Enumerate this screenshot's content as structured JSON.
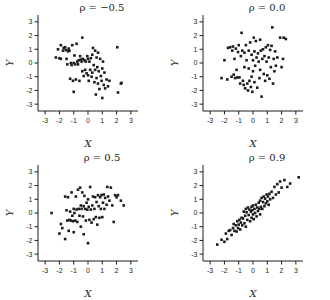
{
  "figure": {
    "background": "#ffffff",
    "ink_color": "#1c1c1c",
    "layout": "2x2-scatter-grid"
  },
  "chart_data": [
    {
      "type": "scatter",
      "title": "ρ = −0.5",
      "rho": -0.5,
      "xlabel": "X",
      "ylabel": "Y",
      "xlim": [
        -3.5,
        3.5
      ],
      "ylim": [
        -3.5,
        3.5
      ],
      "xticks": [
        -3,
        -2,
        -1,
        0,
        1,
        2,
        3
      ],
      "yticks": [
        3,
        2,
        1,
        0,
        -1,
        -2,
        -3
      ],
      "grid": false,
      "marker": "square",
      "points": [
        [
          -2.25,
          0.4
        ],
        [
          -2.1,
          1.0
        ],
        [
          -2.0,
          0.35
        ],
        [
          -1.9,
          0.3
        ],
        [
          -1.9,
          1.3
        ],
        [
          -1.75,
          0.9
        ],
        [
          -1.7,
          1.1
        ],
        [
          -1.6,
          1.15
        ],
        [
          -1.55,
          0.95
        ],
        [
          -1.5,
          0.3
        ],
        [
          -1.45,
          -0.1
        ],
        [
          -1.4,
          0.85
        ],
        [
          -1.35,
          1.05
        ],
        [
          -1.3,
          0.9
        ],
        [
          -1.25,
          -1.15
        ],
        [
          -1.2,
          0.0
        ],
        [
          -1.15,
          -0.15
        ],
        [
          -1.1,
          1.3
        ],
        [
          -1.05,
          -1.3
        ],
        [
          -1.0,
          0.0
        ],
        [
          -1.0,
          -2.1
        ],
        [
          -0.95,
          0.55
        ],
        [
          -0.9,
          -0.1
        ],
        [
          -0.85,
          -1.2
        ],
        [
          -0.8,
          1.4
        ],
        [
          -0.75,
          0.1
        ],
        [
          -0.7,
          -0.1
        ],
        [
          -0.65,
          0.2
        ],
        [
          -0.6,
          -1.3
        ],
        [
          -0.55,
          0.5
        ],
        [
          -0.5,
          0.25
        ],
        [
          -0.45,
          0.1
        ],
        [
          -0.4,
          1.85
        ],
        [
          -0.4,
          -0.6
        ],
        [
          -0.35,
          0.3
        ],
        [
          -0.3,
          -0.95
        ],
        [
          -0.25,
          0.2
        ],
        [
          -0.2,
          -0.5
        ],
        [
          -0.15,
          0.1
        ],
        [
          -0.1,
          -0.75
        ],
        [
          -0.05,
          0.5
        ],
        [
          0.0,
          0.3
        ],
        [
          0.0,
          -0.9
        ],
        [
          0.05,
          -1.3
        ],
        [
          0.1,
          0.1
        ],
        [
          0.15,
          -0.5
        ],
        [
          0.2,
          0.35
        ],
        [
          0.25,
          -1.0
        ],
        [
          0.3,
          0.6
        ],
        [
          0.3,
          -0.7
        ],
        [
          0.35,
          1.1
        ],
        [
          0.4,
          -0.15
        ],
        [
          0.45,
          -1.4
        ],
        [
          0.5,
          0.9
        ],
        [
          0.5,
          -0.5
        ],
        [
          0.55,
          -2.3
        ],
        [
          0.6,
          0.4
        ],
        [
          0.6,
          -1.1
        ],
        [
          0.65,
          -0.3
        ],
        [
          0.7,
          0.75
        ],
        [
          0.7,
          -1.5
        ],
        [
          0.75,
          -0.6
        ],
        [
          0.8,
          -1.9
        ],
        [
          0.85,
          0.3
        ],
        [
          0.9,
          -0.95
        ],
        [
          0.95,
          -1.3
        ],
        [
          1.0,
          -0.4
        ],
        [
          1.0,
          -2.55
        ],
        [
          1.05,
          0.1
        ],
        [
          1.1,
          -1.6
        ],
        [
          1.15,
          -0.7
        ],
        [
          1.2,
          -1.85
        ],
        [
          1.3,
          -1.2
        ],
        [
          1.4,
          -1.7
        ],
        [
          1.5,
          -1.3
        ],
        [
          2.05,
          1.15
        ],
        [
          2.1,
          -2.15
        ],
        [
          2.3,
          -1.5
        ],
        [
          2.35,
          -1.45
        ]
      ]
    },
    {
      "type": "scatter",
      "title": "ρ = 0.0",
      "rho": 0.0,
      "xlabel": "X",
      "ylabel": "Y",
      "xlim": [
        -3.5,
        3.5
      ],
      "ylim": [
        -3.5,
        3.5
      ],
      "xticks": [
        -3,
        -2,
        -1,
        0,
        1,
        2,
        3
      ],
      "yticks": [
        3,
        2,
        1,
        0,
        -1,
        -2,
        -3
      ],
      "grid": false,
      "marker": "square",
      "points": [
        [
          -2.2,
          -1.1
        ],
        [
          -2.0,
          0.2
        ],
        [
          -1.8,
          -1.2
        ],
        [
          -1.75,
          1.1
        ],
        [
          -1.6,
          1.15
        ],
        [
          -1.5,
          -1.0
        ],
        [
          -1.45,
          0.9
        ],
        [
          -1.4,
          1.2
        ],
        [
          -1.35,
          -0.85
        ],
        [
          -1.3,
          0.3
        ],
        [
          -1.25,
          -1.1
        ],
        [
          -1.2,
          1.05
        ],
        [
          -1.15,
          -0.5
        ],
        [
          -1.1,
          -1.05
        ],
        [
          -1.05,
          0.8
        ],
        [
          -1.0,
          1.3
        ],
        [
          -0.95,
          -1.05
        ],
        [
          -0.9,
          -1.5
        ],
        [
          -0.85,
          0.5
        ],
        [
          -0.8,
          2.2
        ],
        [
          -0.75,
          0.9
        ],
        [
          -0.7,
          -1.3
        ],
        [
          -0.65,
          -1.6
        ],
        [
          -0.6,
          0.75
        ],
        [
          -0.6,
          -0.3
        ],
        [
          -0.55,
          -1.85
        ],
        [
          -0.5,
          1.3
        ],
        [
          -0.45,
          0.2
        ],
        [
          -0.4,
          -1.5
        ],
        [
          -0.35,
          -2.0
        ],
        [
          -0.3,
          0.9
        ],
        [
          -0.3,
          -0.4
        ],
        [
          -0.25,
          -1.3
        ],
        [
          -0.2,
          1.5
        ],
        [
          -0.15,
          -1.75
        ],
        [
          -0.1,
          0.6
        ],
        [
          -0.1,
          -1.0
        ],
        [
          -0.05,
          -2.1
        ],
        [
          0.0,
          0.2
        ],
        [
          0.0,
          -0.6
        ],
        [
          0.05,
          1.85
        ],
        [
          0.1,
          0.85
        ],
        [
          0.1,
          -1.4
        ],
        [
          0.15,
          -0.2
        ],
        [
          0.2,
          1.6
        ],
        [
          0.25,
          0.4
        ],
        [
          0.3,
          -1.8
        ],
        [
          0.35,
          0.7
        ],
        [
          0.4,
          0.1
        ],
        [
          0.45,
          -1.1
        ],
        [
          0.5,
          1.7
        ],
        [
          0.5,
          -0.5
        ],
        [
          0.55,
          0.9
        ],
        [
          0.6,
          -2.45
        ],
        [
          0.65,
          0.3
        ],
        [
          0.7,
          1.0
        ],
        [
          0.75,
          -0.8
        ],
        [
          0.8,
          0.5
        ],
        [
          0.85,
          -1.3
        ],
        [
          0.9,
          1.15
        ],
        [
          0.95,
          0.1
        ],
        [
          1.0,
          -0.9
        ],
        [
          1.05,
          1.3
        ],
        [
          1.1,
          0.4
        ],
        [
          1.15,
          -1.15
        ],
        [
          1.2,
          0.95
        ],
        [
          1.25,
          -0.3
        ],
        [
          1.3,
          1.25
        ],
        [
          1.35,
          2.6
        ],
        [
          1.4,
          -1.5
        ],
        [
          1.45,
          0.3
        ],
        [
          1.5,
          -0.6
        ],
        [
          1.55,
          0.85
        ],
        [
          1.6,
          -0.2
        ],
        [
          1.7,
          0.4
        ],
        [
          1.9,
          1.85
        ],
        [
          2.0,
          -0.3
        ],
        [
          2.1,
          0.3
        ],
        [
          2.15,
          1.85
        ],
        [
          2.3,
          1.75
        ]
      ]
    },
    {
      "type": "scatter",
      "title": "ρ = 0.5",
      "rho": 0.5,
      "xlabel": "X",
      "ylabel": "Y",
      "xlim": [
        -3.5,
        3.5
      ],
      "ylim": [
        -3.5,
        3.5
      ],
      "xticks": [
        -3,
        -2,
        -1,
        0,
        1,
        2,
        3
      ],
      "yticks": [
        3,
        2,
        1,
        0,
        -1,
        -2,
        -3
      ],
      "grid": false,
      "marker": "square",
      "points": [
        [
          -2.55,
          0.0
        ],
        [
          -2.0,
          -1.5
        ],
        [
          -1.9,
          -0.8
        ],
        [
          -1.8,
          -1.1
        ],
        [
          -1.6,
          -1.9
        ],
        [
          -1.6,
          1.2
        ],
        [
          -1.5,
          0.2
        ],
        [
          -1.45,
          -0.55
        ],
        [
          -1.4,
          1.15
        ],
        [
          -1.35,
          -1.3
        ],
        [
          -1.3,
          -0.5
        ],
        [
          -1.25,
          0.1
        ],
        [
          -1.2,
          -0.55
        ],
        [
          -1.15,
          1.5
        ],
        [
          -1.1,
          -0.2
        ],
        [
          -1.05,
          -0.6
        ],
        [
          -1.0,
          0.3
        ],
        [
          -1.0,
          -1.4
        ],
        [
          -0.95,
          0.0
        ],
        [
          -0.9,
          -0.55
        ],
        [
          -0.85,
          1.2
        ],
        [
          -0.8,
          0.25
        ],
        [
          -0.75,
          -0.65
        ],
        [
          -0.7,
          1.7
        ],
        [
          -0.65,
          0.3
        ],
        [
          -0.6,
          -0.2
        ],
        [
          -0.55,
          1.85
        ],
        [
          -0.5,
          0.55
        ],
        [
          -0.5,
          -1.0
        ],
        [
          -0.45,
          0.3
        ],
        [
          -0.4,
          1.5
        ],
        [
          -0.35,
          -0.25
        ],
        [
          -0.3,
          0.5
        ],
        [
          -0.3,
          -1.55
        ],
        [
          -0.25,
          1.25
        ],
        [
          -0.2,
          0.3
        ],
        [
          -0.15,
          -0.55
        ],
        [
          -0.1,
          0.75
        ],
        [
          -0.05,
          0.25
        ],
        [
          0.0,
          -2.2
        ],
        [
          0.0,
          1.0
        ],
        [
          0.05,
          0.45
        ],
        [
          0.1,
          -0.5
        ],
        [
          0.15,
          1.9
        ],
        [
          0.2,
          0.25
        ],
        [
          0.25,
          -0.7
        ],
        [
          0.3,
          0.55
        ],
        [
          0.35,
          1.2
        ],
        [
          0.4,
          -0.45
        ],
        [
          0.45,
          0.3
        ],
        [
          0.5,
          1.15
        ],
        [
          0.55,
          -0.3
        ],
        [
          0.6,
          0.8
        ],
        [
          0.65,
          -0.85
        ],
        [
          0.7,
          1.3
        ],
        [
          0.75,
          0.5
        ],
        [
          0.8,
          -0.35
        ],
        [
          0.85,
          1.15
        ],
        [
          0.9,
          0.3
        ],
        [
          0.95,
          1.3
        ],
        [
          1.0,
          -0.3
        ],
        [
          1.05,
          0.75
        ],
        [
          1.1,
          1.35
        ],
        [
          1.15,
          0.3
        ],
        [
          1.2,
          1.1
        ],
        [
          1.3,
          0.6
        ],
        [
          1.35,
          1.9
        ],
        [
          1.4,
          1.2
        ],
        [
          1.5,
          0.9
        ],
        [
          1.6,
          1.85
        ],
        [
          1.7,
          0.55
        ],
        [
          1.8,
          -0.65
        ],
        [
          1.9,
          1.3
        ],
        [
          2.0,
          1.15
        ],
        [
          2.1,
          1.3
        ],
        [
          2.3,
          0.9
        ],
        [
          2.5,
          0.55
        ]
      ]
    },
    {
      "type": "scatter",
      "title": "ρ = 0.9",
      "rho": 0.9,
      "xlabel": "X",
      "ylabel": "Y",
      "xlim": [
        -3.5,
        3.5
      ],
      "ylim": [
        -3.5,
        3.5
      ],
      "xticks": [
        -3,
        -2,
        -1,
        0,
        1,
        2,
        3
      ],
      "yticks": [
        3,
        2,
        1,
        0,
        -1,
        -2,
        -3
      ],
      "grid": false,
      "marker": "square",
      "points": [
        [
          -2.5,
          -2.3
        ],
        [
          -2.2,
          -1.95
        ],
        [
          -2.0,
          -2.1
        ],
        [
          -1.9,
          -1.5
        ],
        [
          -1.8,
          -1.9
        ],
        [
          -1.7,
          -1.3
        ],
        [
          -1.6,
          -1.25
        ],
        [
          -1.5,
          -1.6
        ],
        [
          -1.4,
          -1.1
        ],
        [
          -1.35,
          -0.8
        ],
        [
          -1.3,
          -1.3
        ],
        [
          -1.2,
          -0.9
        ],
        [
          -1.15,
          -1.35
        ],
        [
          -1.1,
          -0.6
        ],
        [
          -1.05,
          -1.1
        ],
        [
          -1.0,
          -0.85
        ],
        [
          -0.95,
          -0.5
        ],
        [
          -0.9,
          -1.2
        ],
        [
          -0.85,
          -0.7
        ],
        [
          -0.8,
          -0.35
        ],
        [
          -0.75,
          -0.9
        ],
        [
          -0.7,
          -0.4
        ],
        [
          -0.65,
          0.1
        ],
        [
          -0.6,
          -0.75
        ],
        [
          -0.55,
          -0.2
        ],
        [
          -0.5,
          0.3
        ],
        [
          -0.5,
          -1.0
        ],
        [
          -0.45,
          0.05
        ],
        [
          -0.4,
          -0.5
        ],
        [
          -0.35,
          0.4
        ],
        [
          -0.3,
          -0.15
        ],
        [
          -0.25,
          0.25
        ],
        [
          -0.2,
          -0.6
        ],
        [
          -0.15,
          0.1
        ],
        [
          -0.1,
          0.45
        ],
        [
          -0.1,
          -0.35
        ],
        [
          -0.05,
          0.2
        ],
        [
          0.0,
          -0.1
        ],
        [
          0.0,
          0.55
        ],
        [
          0.05,
          -0.45
        ],
        [
          0.1,
          0.3
        ],
        [
          0.15,
          0.0
        ],
        [
          0.2,
          0.6
        ],
        [
          0.25,
          -0.25
        ],
        [
          0.3,
          0.4
        ],
        [
          0.35,
          0.15
        ],
        [
          0.4,
          0.75
        ],
        [
          0.45,
          0.3
        ],
        [
          0.5,
          -0.1
        ],
        [
          0.5,
          0.9
        ],
        [
          0.55,
          0.45
        ],
        [
          0.6,
          1.1
        ],
        [
          0.65,
          0.3
        ],
        [
          0.7,
          0.8
        ],
        [
          0.75,
          1.2
        ],
        [
          0.8,
          0.5
        ],
        [
          0.85,
          1.05
        ],
        [
          0.9,
          0.7
        ],
        [
          0.95,
          1.35
        ],
        [
          1.0,
          0.85
        ],
        [
          1.05,
          1.2
        ],
        [
          1.1,
          0.6
        ],
        [
          1.15,
          1.4
        ],
        [
          1.2,
          1.0
        ],
        [
          1.3,
          1.55
        ],
        [
          1.4,
          1.1
        ],
        [
          1.5,
          1.9
        ],
        [
          1.6,
          1.35
        ],
        [
          1.7,
          2.1
        ],
        [
          1.8,
          1.5
        ],
        [
          1.9,
          2.3
        ],
        [
          2.0,
          1.85
        ],
        [
          2.2,
          2.4
        ],
        [
          2.4,
          1.9
        ],
        [
          2.6,
          2.15
        ],
        [
          3.2,
          2.6
        ]
      ]
    }
  ]
}
